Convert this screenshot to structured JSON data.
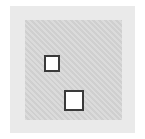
{
  "figure": {
    "colors": {
      "background": "#ffffff",
      "outer_panel": "#eaeaea",
      "inner_panel": "#d6d6d6",
      "box_fill": "#ffffff",
      "box_border": "#3a3a3a"
    },
    "boxes": [
      {
        "id": "small",
        "x": 44,
        "y": 55,
        "w": 16,
        "h": 17
      },
      {
        "id": "large",
        "x": 64,
        "y": 90,
        "w": 20,
        "h": 21
      }
    ]
  }
}
